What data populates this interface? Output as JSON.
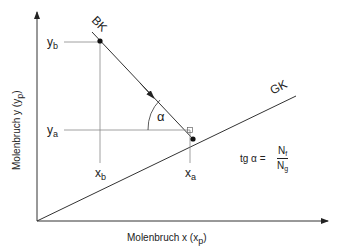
{
  "diagram": {
    "axes": {
      "x_label": "Molenbruch  x  (x",
      "x_label_sub": "p",
      "x_label_close": ")",
      "y_label": "Molenbruch  y  (y",
      "y_label_sub": "p",
      "y_label_close": ")"
    },
    "lines": {
      "operating_line": "BK",
      "equilibrium_line": "GK"
    },
    "points": {
      "ya": {
        "base": "y",
        "sub": "a"
      },
      "yb": {
        "base": "y",
        "sub": "b"
      },
      "xa": {
        "base": "x",
        "sub": "a"
      },
      "xb": {
        "base": "x",
        "sub": "b"
      }
    },
    "angle": "α",
    "formula": {
      "lhs": "tg α =",
      "numerator_base": "N",
      "numerator_sub": "f",
      "denominator_base": "N",
      "denominator_sub": "g"
    },
    "colors": {
      "line": "#333333",
      "guide": "#888888"
    }
  }
}
